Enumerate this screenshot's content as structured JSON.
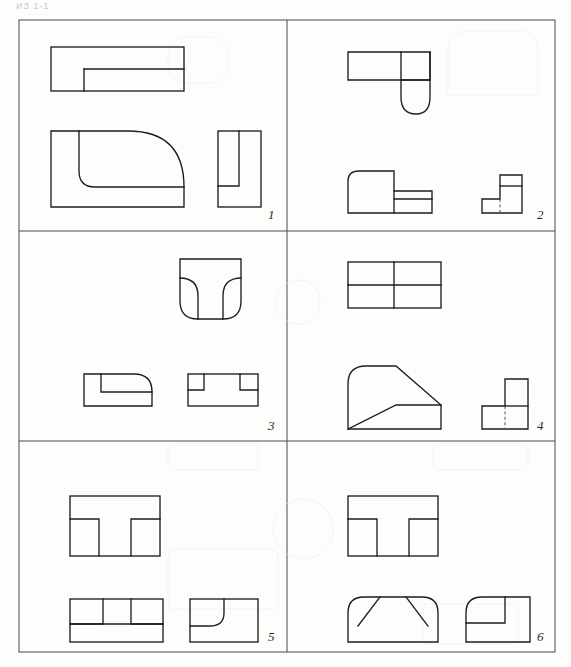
{
  "page": {
    "header_text": "ИЗ 1-1",
    "width": 571,
    "height": 667,
    "background_color": "#fdfdfc",
    "line_color": "#1d1d1d",
    "frame_color": "#4a4a4a"
  },
  "sheet": {
    "type": "orthographic-projection-exercise",
    "rows": 3,
    "columns": 2,
    "panel_count": 6,
    "frame": {
      "x": 18,
      "y": 19,
      "width": 538,
      "height": 634
    }
  },
  "panels": [
    {
      "number": "1",
      "label_position": "bottom-right",
      "views": [
        {
          "name": "top-view",
          "description": "rectangle with inner step rectangle along lower-right portion",
          "shape": "stepped-rectangle"
        },
        {
          "name": "front-view",
          "description": "rectangle with large quarter-round fillet on upper-right and inner small fillet corner",
          "shape": "rounded-corner-block"
        },
        {
          "name": "side-view",
          "description": "tall rectangle with inner open slot rectangle",
          "shape": "slotted-rectangle"
        }
      ]
    },
    {
      "number": "2",
      "label_position": "bottom-right",
      "views": [
        {
          "name": "top-view",
          "description": "horizontal rectangle with semicircular rounded tab projecting downward at right",
          "shape": "rectangle-with-round-end"
        },
        {
          "name": "front-view",
          "description": "L-stepped block with rounded upper-left corner and lower right step",
          "shape": "stepped-block-rounded"
        },
        {
          "name": "side-view",
          "description": "L-shaped profile with vertical hidden dashed line",
          "shape": "L-profile-hidden-line"
        }
      ]
    },
    {
      "number": "3",
      "label_position": "bottom-right",
      "views": [
        {
          "name": "top-view",
          "description": "rectangle with rounded bottom corners and two inner fillet arcs forming a T/U shape",
          "shape": "double-fillet-U"
        },
        {
          "name": "front-view",
          "description": "rectangle with rounded upper-right corner and inner step ledge",
          "shape": "rounded-step-block"
        },
        {
          "name": "side-view",
          "description": "rectangle with two inner notch rectangles at top left and top right",
          "shape": "double-notch-rectangle"
        }
      ]
    },
    {
      "number": "4",
      "label_position": "bottom-right",
      "views": [
        {
          "name": "top-view",
          "description": "rectangle divided into four cells by one vertical and one horizontal line",
          "shape": "quartered-rectangle"
        },
        {
          "name": "front-view",
          "description": "block with rounded upper-left corner, sloped top-right edge and sloped inner wedge line",
          "shape": "sloped-wedge-block"
        },
        {
          "name": "side-view",
          "description": "L-shaped profile with vertical hidden dashed line",
          "shape": "L-profile-hidden-line"
        }
      ]
    },
    {
      "number": "5",
      "label_position": "bottom-right",
      "views": [
        {
          "name": "top-view",
          "description": "rectangle with central T-shaped rib formed by two inner slot rectangles",
          "shape": "T-rib-rectangle"
        },
        {
          "name": "front-view",
          "description": "rectangle with two inner notch rectangles and a horizontal base band",
          "shape": "double-notch-with-base"
        },
        {
          "name": "side-view",
          "description": "rectangle with inner concave quarter-arc fillet",
          "shape": "concave-fillet-rectangle"
        }
      ]
    },
    {
      "number": "6",
      "label_position": "bottom-right",
      "views": [
        {
          "name": "top-view",
          "description": "rectangle with central T-shaped rib formed by two inner slot rectangles",
          "shape": "T-rib-rectangle"
        },
        {
          "name": "front-view",
          "description": "block with rounded top corners and two symmetric chamfer lines forming a trapezoid",
          "shape": "rounded-chamfer-block"
        },
        {
          "name": "side-view",
          "description": "rectangle with rounded upper-left corner and inner L-step outline",
          "shape": "rounded-L-step"
        }
      ]
    }
  ]
}
